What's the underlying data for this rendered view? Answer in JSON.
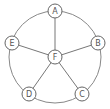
{
  "diagram": {
    "type": "wheel-graph",
    "ring": {
      "cx": 55,
      "cy": 57,
      "r": 46
    },
    "center_node": {
      "id": "F",
      "label": "F",
      "x": 55,
      "y": 57
    },
    "outer_nodes": [
      {
        "id": "A",
        "label": "A",
        "x": 55,
        "y": 11
      },
      {
        "id": "B",
        "label": "B",
        "x": 98,
        "y": 43
      },
      {
        "id": "C",
        "label": "C",
        "x": 82,
        "y": 94
      },
      {
        "id": "D",
        "label": "D",
        "x": 29,
        "y": 94
      },
      {
        "id": "E",
        "label": "E",
        "x": 12,
        "y": 43
      }
    ],
    "node_radius": 7,
    "spokes": [
      [
        "F",
        "A"
      ],
      [
        "F",
        "B"
      ],
      [
        "F",
        "C"
      ],
      [
        "F",
        "D"
      ],
      [
        "F",
        "E"
      ]
    ],
    "rim_edges": [
      [
        "A",
        "B"
      ],
      [
        "B",
        "C"
      ],
      [
        "C",
        "D"
      ],
      [
        "D",
        "E"
      ],
      [
        "E",
        "A"
      ]
    ],
    "colors": {
      "stroke": "#666666",
      "label": "#555555",
      "background": "#ffffff"
    }
  }
}
